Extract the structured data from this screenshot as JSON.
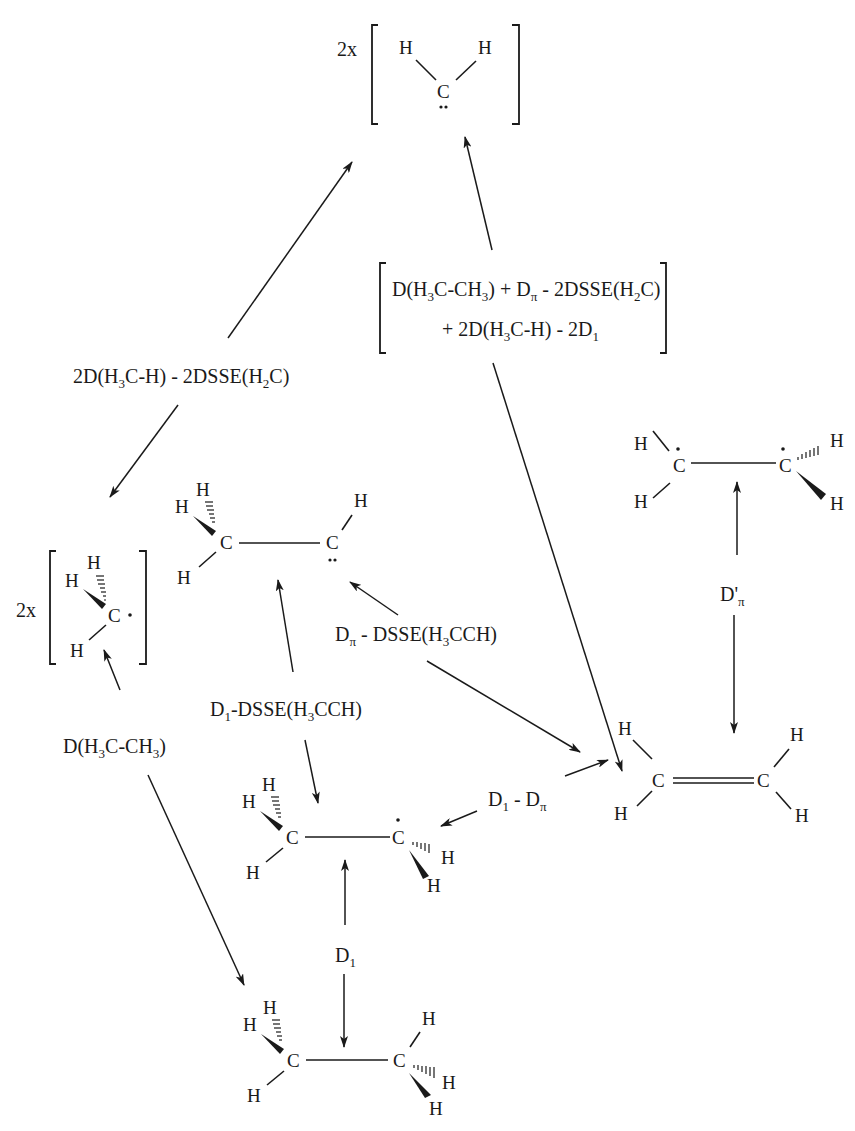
{
  "diagram": {
    "type": "thermochemical cycle",
    "species": {
      "methylene": {
        "multiplier": "2x",
        "atoms": [
          "H",
          "H",
          "C"
        ],
        "lone_pair": true
      },
      "methyl": {
        "multiplier": "2x",
        "atoms": [
          "H",
          "H",
          "H",
          "C"
        ],
        "radical": true
      },
      "ethylidene": {
        "atoms": [
          "H",
          "H",
          "H",
          "C",
          "C",
          "H"
        ],
        "lone_pair": true
      },
      "ethyl": {
        "atoms": [
          "H",
          "H",
          "H",
          "C",
          "C",
          "H",
          "H"
        ],
        "radical": true
      },
      "ethane": {
        "atoms": [
          "H",
          "H",
          "H",
          "C",
          "C",
          "H",
          "H",
          "H"
        ]
      },
      "ethylene": {
        "atoms": [
          "H",
          "H",
          "C",
          "C",
          "H",
          "H"
        ]
      },
      "twisted_ethylene": {
        "atoms": [
          "H",
          "H",
          "C",
          "C",
          "H",
          "H"
        ],
        "diradical": true
      }
    },
    "labels": {
      "methyl_to_methylene": {
        "text": "2D(H3C-H) - 2DSSE(H2C)",
        "parts": [
          "2D(H",
          "3",
          "C-H) - 2DSSE(H",
          "2",
          "C)"
        ]
      },
      "ethylene_to_methylene_line1": {
        "parts": [
          "D(H",
          "3",
          "C-CH",
          "3",
          ") + D",
          "π",
          " - 2DSSE(H",
          "2",
          "C)"
        ]
      },
      "ethylene_to_methylene_line2": {
        "parts": [
          "+ 2D(H",
          "3",
          "C-H) - 2D",
          "1"
        ]
      },
      "ethane_to_methyl": {
        "parts": [
          "D(H",
          "3",
          "C-CH",
          "3",
          ")"
        ]
      },
      "ethyl_to_ethylidene": {
        "parts": [
          "D",
          "1",
          "-DSSE(H",
          "3",
          "CCH)"
        ]
      },
      "ethylene_to_ethylidene": {
        "parts": [
          "D",
          "π",
          " - DSSE(H",
          "3",
          "CCH)"
        ]
      },
      "ethyl_to_ethylene": {
        "parts": [
          "D",
          "1",
          " - D",
          "π"
        ]
      },
      "ethane_to_ethyl": {
        "parts": [
          "D",
          "1"
        ]
      },
      "ethylene_to_twisted": {
        "parts": [
          "D'",
          "π"
        ]
      }
    },
    "atom_symbols": {
      "C": "C",
      "H": "H"
    },
    "multiplier": "2x"
  }
}
